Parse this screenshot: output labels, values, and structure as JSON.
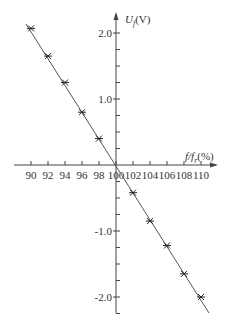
{
  "chart_data": {
    "type": "line",
    "title": "",
    "xlabel": "f/f_r(%)",
    "ylabel": "U_f(V)",
    "xlabel_main": "f/f",
    "xlabel_sub": "r",
    "xlabel_unit": "(%)",
    "ylabel_main": "U",
    "ylabel_sub": "f",
    "ylabel_unit": "(V)",
    "x_ticks": [
      90,
      92,
      94,
      96,
      98,
      100,
      102,
      104,
      106,
      108,
      110
    ],
    "x_tick_labels": [
      "90",
      "92",
      "94",
      "96",
      "98",
      "100",
      "102",
      "104",
      "106",
      "108",
      "110"
    ],
    "y_tick_labels": [
      "2.0",
      "1.0",
      "-1.0",
      "-2.0"
    ],
    "y_ticks": [
      2.0,
      1.0,
      -1.0,
      -2.0
    ],
    "xlim": [
      89,
      112
    ],
    "ylim": [
      -2.25,
      2.3
    ],
    "grid": false,
    "marker": "x",
    "x": [
      90,
      92,
      94,
      96,
      98,
      100,
      102,
      104,
      106,
      108,
      110
    ],
    "series": [
      {
        "name": "U_f",
        "values": [
          2.07,
          1.65,
          1.25,
          0.8,
          0.4,
          0.0,
          -0.42,
          -0.85,
          -1.22,
          -1.65,
          -2.0
        ]
      }
    ]
  }
}
